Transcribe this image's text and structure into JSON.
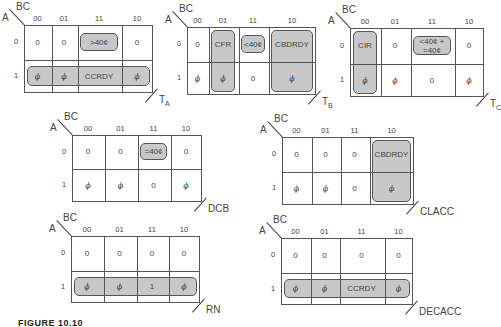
{
  "figure": {
    "caption": "FIGURE 10.10"
  },
  "axes": {
    "row_var": "A",
    "col_var": "BC",
    "cols": [
      "00",
      "01",
      "11",
      "10"
    ],
    "rows": [
      "0",
      "1"
    ]
  },
  "maps": [
    {
      "name": "T_A",
      "label": "T",
      "sub": "A",
      "x": 24,
      "y": 25,
      "colx": [
        0,
        27,
        53,
        97,
        129
      ],
      "h": 68,
      "mid": 34,
      "cells": [
        [
          "0",
          "0",
          ">40¢",
          "0"
        ],
        [
          "ϕ",
          "ϕ",
          "CCRDY",
          "ϕ"
        ]
      ],
      "groups": [
        {
          "c0": 2,
          "c1": 2,
          "r0": 0,
          "r1": 0
        },
        {
          "c0": 0,
          "c1": 3,
          "r0": 1,
          "r1": 1
        }
      ]
    },
    {
      "name": "T_B",
      "label": "T",
      "sub": "B",
      "x": 187,
      "y": 27,
      "colx": [
        0,
        21,
        51,
        81,
        129
      ],
      "h": 68,
      "mid": 34,
      "cells": [
        [
          "0",
          "CFR",
          "<40¢",
          "CBDRDY"
        ],
        [
          "ϕ",
          "ϕ",
          "0",
          "ϕ"
        ]
      ],
      "groups": [
        {
          "c0": 1,
          "c1": 1,
          "r0": 0,
          "r1": 1
        },
        {
          "c0": 2,
          "c1": 2,
          "r0": 0,
          "r1": 0
        },
        {
          "c0": 3,
          "c1": 3,
          "r0": 0,
          "r1": 1
        }
      ]
    },
    {
      "name": "T_C",
      "label": "T",
      "sub": "C",
      "x": 350,
      "y": 28,
      "colx": [
        0,
        30,
        60,
        104,
        134
      ],
      "h": 69,
      "mid": 35,
      "cells": [
        [
          "CIR",
          "0",
          "<40¢ +\n=40¢",
          "0"
        ],
        [
          "ϕ",
          "ϕ",
          "0",
          "ϕ"
        ]
      ],
      "groups": [
        {
          "c0": 0,
          "c1": 0,
          "r0": 0,
          "r1": 1
        },
        {
          "c0": 2,
          "c1": 2,
          "r0": 0,
          "r1": 0
        }
      ]
    },
    {
      "name": "DCB",
      "label": "DCB",
      "sub": "",
      "x": 72,
      "y": 135,
      "colx": [
        0,
        32,
        65,
        98,
        130
      ],
      "h": 67,
      "mid": 33,
      "cells": [
        [
          "0",
          "0",
          "=40¢",
          "0"
        ],
        [
          "ϕ",
          "ϕ",
          "0",
          "ϕ"
        ]
      ],
      "groups": [
        {
          "c0": 2,
          "c1": 2,
          "r0": 0,
          "r1": 0
        }
      ]
    },
    {
      "name": "CLACC",
      "label": "CLACC",
      "sub": "",
      "x": 282,
      "y": 137,
      "colx": [
        0,
        29,
        58,
        87,
        132
      ],
      "h": 68,
      "mid": 34,
      "cells": [
        [
          "0",
          "0",
          "0",
          "CBDRDY"
        ],
        [
          "ϕ",
          "ϕ",
          "0",
          "ϕ"
        ]
      ],
      "groups": [
        {
          "c0": 3,
          "c1": 3,
          "r0": 0,
          "r1": 1
        }
      ]
    },
    {
      "name": "RN",
      "label": "RN",
      "sub": "",
      "x": 71,
      "y": 236,
      "colx": [
        0,
        32,
        65,
        97,
        129
      ],
      "h": 67,
      "mid": 34,
      "cells": [
        [
          "0",
          "0",
          "0",
          "0"
        ],
        [
          "ϕ",
          "ϕ",
          "1",
          "ϕ"
        ]
      ],
      "groups": [
        {
          "c0": 0,
          "c1": 3,
          "r0": 1,
          "r1": 1
        }
      ]
    },
    {
      "name": "DECACC",
      "label": "DECACC",
      "sub": "",
      "x": 281,
      "y": 238,
      "colx": [
        0,
        29,
        58,
        103,
        132
      ],
      "h": 67,
      "mid": 34,
      "cells": [
        [
          "0",
          "0",
          "0",
          "0"
        ],
        [
          "ϕ",
          "ϕ",
          "CCRDY",
          "ϕ"
        ]
      ],
      "groups": [
        {
          "c0": 0,
          "c1": 3,
          "r0": 1,
          "r1": 1
        }
      ]
    }
  ]
}
